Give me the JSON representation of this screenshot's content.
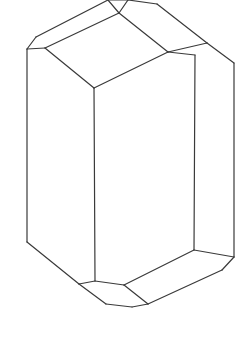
{
  "figure": {
    "background": "#ffffff",
    "line_color": "#3a3a3a",
    "width": 244,
    "height": 341
  },
  "vertices": {
    "A": [
      108,
      0
    ],
    "B": [
      128,
      0
    ],
    "C": [
      157,
      4
    ],
    "D": [
      119,
      13
    ],
    "E": [
      36,
      37
    ],
    "F": [
      27,
      49
    ],
    "G": [
      45,
      48
    ],
    "H": [
      168,
      52
    ],
    "I": [
      195,
      55
    ],
    "J": [
      207,
      43
    ],
    "K": [
      234,
      63
    ],
    "L": [
      94,
      88
    ],
    "M": [
      27,
      242
    ],
    "N": [
      79,
      284
    ],
    "O": [
      95,
      281
    ],
    "P": [
      124,
      285
    ],
    "Q": [
      194,
      250
    ],
    "R": [
      234,
      257
    ],
    "S": [
      222,
      270
    ],
    "T": [
      148,
      304
    ],
    "U": [
      106,
      304
    ],
    "V": [
      132,
      307
    ]
  },
  "faces": [
    {
      "name": "top-face",
      "points": [
        "D",
        "G",
        "L",
        "H"
      ]
    },
    {
      "name": "top-left-bevel",
      "points": [
        "A",
        "D",
        "G",
        "F",
        "E"
      ]
    },
    {
      "name": "top-right-bevel",
      "points": [
        "B",
        "C",
        "J",
        "I",
        "H",
        "D"
      ]
    },
    {
      "name": "left-prism-face",
      "points": [
        "F",
        "G",
        "L",
        "O",
        "N",
        "M"
      ]
    },
    {
      "name": "front-prism-face",
      "points": [
        "L",
        "H",
        "I",
        "Q",
        "P",
        "O"
      ]
    },
    {
      "name": "right-prism-face",
      "points": [
        "I",
        "J",
        "K",
        "R",
        "Q"
      ]
    },
    {
      "name": "bottom-face",
      "points": [
        "Q",
        "R",
        "S",
        "T",
        "P"
      ]
    },
    {
      "name": "bottom-left-face",
      "points": [
        "N",
        "O",
        "P",
        "T",
        "V",
        "U"
      ]
    }
  ],
  "edges": [
    [
      "A",
      "B"
    ],
    [
      "B",
      "C"
    ],
    [
      "A",
      "D"
    ],
    [
      "A",
      "E"
    ],
    [
      "E",
      "F"
    ],
    [
      "F",
      "G"
    ],
    [
      "G",
      "D"
    ],
    [
      "B",
      "D"
    ],
    [
      "D",
      "H"
    ],
    [
      "G",
      "L"
    ],
    [
      "L",
      "H"
    ],
    [
      "H",
      "I"
    ],
    [
      "H",
      "J"
    ],
    [
      "C",
      "J"
    ],
    [
      "J",
      "K"
    ],
    [
      "I",
      "Q"
    ],
    [
      "K",
      "R"
    ],
    [
      "R",
      "S"
    ],
    [
      "L",
      "O"
    ],
    [
      "F",
      "M"
    ],
    [
      "M",
      "N"
    ],
    [
      "N",
      "O"
    ],
    [
      "O",
      "P"
    ],
    [
      "P",
      "Q"
    ],
    [
      "Q",
      "R"
    ],
    [
      "P",
      "T"
    ],
    [
      "S",
      "T"
    ],
    [
      "N",
      "U"
    ],
    [
      "U",
      "V"
    ],
    [
      "V",
      "T"
    ]
  ]
}
